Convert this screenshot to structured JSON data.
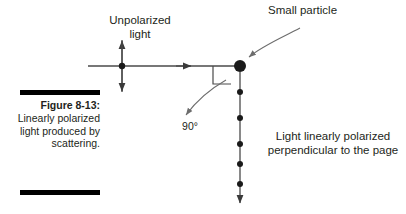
{
  "figure": {
    "caption_title": "Figure 8-13:",
    "caption_body": "Linearly polarized light produced by scattering.",
    "ink_color": "#231f20",
    "rule_color": "#000000"
  },
  "labels": {
    "unpolarized_light": "Unpolarized\nlight",
    "small_particle": "Small particle",
    "angle": "90°",
    "polarized_note": "Light linearly polarized\nperpendicular to the page"
  },
  "diagram": {
    "incoming_ray": {
      "name": "unpolarized-incoming-ray",
      "direction": "rightward",
      "start_x": 88,
      "end_x": 240,
      "y": 66,
      "arrowhead_x": 190
    },
    "oscillation_arrow": {
      "name": "unpolarized-oscillation-arrow",
      "orientation": "vertical-double-headed",
      "x": 122,
      "top_y": 40,
      "bottom_y": 92
    },
    "field_dot": {
      "name": "unpolarized-field-dot",
      "x": 122,
      "y": 66,
      "radius": 3.2
    },
    "particle": {
      "name": "scattering-particle",
      "x": 240,
      "y": 66,
      "radius": 6.0
    },
    "right_angle_marker": {
      "name": "right-angle-marker",
      "x": 213,
      "y": 66,
      "size": 18
    },
    "scattered_ray": {
      "name": "scattered-polarized-ray",
      "direction": "downward",
      "x": 240,
      "start_y": 72,
      "end_y": 204,
      "dot_count": 5,
      "dot_ys": [
        92,
        118,
        144,
        164,
        184
      ]
    },
    "pointer_small_particle": {
      "name": "small-particle-pointer",
      "from_x": 300,
      "from_y": 28,
      "to_x": 247,
      "to_y": 58
    },
    "pointer_angle": {
      "name": "angle-pointer",
      "from_x": 224,
      "from_y": 82,
      "to_x": 184,
      "to_y": 117
    }
  }
}
